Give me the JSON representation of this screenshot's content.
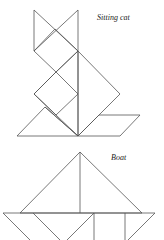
{
  "figures": [
    {
      "name": "Sitting cat",
      "label": "Sitting cat"
    },
    {
      "name": "Boat",
      "label": "Boat"
    }
  ],
  "colors": {
    "line": "#555555",
    "background": "#ffffff",
    "text": "#222222"
  }
}
